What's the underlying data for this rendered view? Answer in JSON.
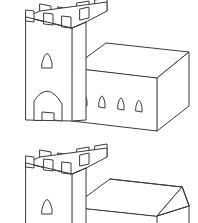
{
  "document": {
    "kind": "line-art-illustration",
    "title": "Castle with tower — two roof variants",
    "background_color": "#ffffff",
    "stroke_color": "#3a3a3a",
    "stroke_width": 1,
    "canvas": {
      "width": 198,
      "height": 223
    },
    "figure_count": 2
  },
  "figures": [
    {
      "id": "figure-top",
      "label": "Castle with flat roofed hall",
      "roof_type": "flat",
      "bounds": {
        "x": 18,
        "y": 2,
        "width": 172,
        "height": 132
      },
      "tower": {
        "label": "Crenellated tower",
        "battlement_merlon_count": 4,
        "window_count": 1,
        "door_count": 1,
        "door_shape": "pointed-arch",
        "window_shape": "pointed-arch"
      },
      "hall": {
        "label": "Rectangular hall block",
        "projection": "isometric-box",
        "visible_faces": [
          "top",
          "front",
          "right"
        ],
        "window_count": 4,
        "window_shape": "pointed-arch"
      }
    },
    {
      "id": "figure-bottom",
      "label": "Castle with hipped roof hall",
      "roof_type": "hipped",
      "bounds": {
        "x": 18,
        "y": 148,
        "width": 172,
        "height": 75
      },
      "cropped_at_canvas_edge": true,
      "tower": {
        "label": "Crenellated tower",
        "battlement_merlon_count": 4,
        "window_count": 1,
        "door_count": 0,
        "window_shape": "pointed-arch"
      },
      "hall": {
        "label": "Rectangular hall block with hip roof",
        "projection": "isometric-box",
        "visible_faces": [
          "roof-left",
          "roof-right-hip",
          "front"
        ],
        "window_count": 0
      }
    }
  ]
}
